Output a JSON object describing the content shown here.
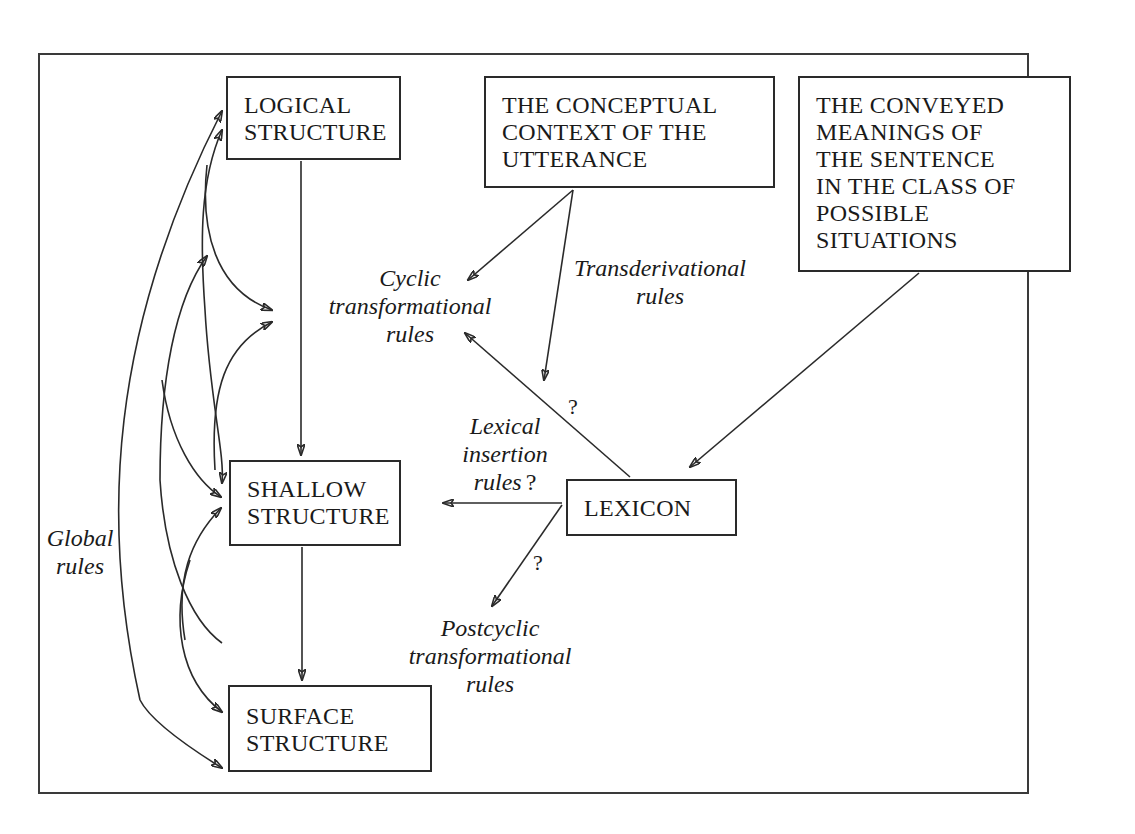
{
  "diagram": {
    "type": "flow-diagram",
    "nodes": {
      "logical_structure": {
        "lines": [
          "LOGICAL",
          "STRUCTURE"
        ]
      },
      "conceptual_context": {
        "lines": [
          "THE CONCEPTUAL",
          "CONTEXT OF THE",
          "UTTERANCE"
        ]
      },
      "conveyed_meanings": {
        "lines": [
          "THE CONVEYED",
          "MEANINGS OF",
          "THE SENTENCE",
          "IN THE CLASS OF",
          "POSSIBLE",
          "SITUATIONS"
        ]
      },
      "shallow_structure": {
        "lines": [
          "SHALLOW",
          "STRUCTURE"
        ]
      },
      "lexicon": {
        "lines": [
          "LEXICON"
        ]
      },
      "surface_structure": {
        "lines": [
          "SURFACE",
          "STRUCTURE"
        ]
      }
    },
    "labels": {
      "cyclic_rules": {
        "lines": [
          "Cyclic",
          "transformational",
          "rules"
        ]
      },
      "transderivational_rules": {
        "lines": [
          "Transderivational",
          "rules"
        ]
      },
      "lexical_insertion_rules": {
        "lines": [
          "Lexical",
          "insertion",
          "rules"
        ],
        "suffix": "?"
      },
      "postcyclic_rules": {
        "lines": [
          "Postcyclic",
          "transformational",
          "rules"
        ]
      },
      "global_rules": {
        "lines": [
          "Global",
          "rules"
        ]
      }
    },
    "question_marks": {
      "lexicon_to_cyclic": "?",
      "lexicon_to_postcyclic": "?"
    },
    "edges": [
      {
        "from": "logical_structure",
        "to": "shallow_structure",
        "label": ""
      },
      {
        "from": "shallow_structure",
        "to": "surface_structure",
        "label": ""
      },
      {
        "from": "conceptual_context",
        "to": "cyclic_rules",
        "label": ""
      },
      {
        "from": "conceptual_context",
        "to": "lexicon_region",
        "label": "Transderivational rules"
      },
      {
        "from": "conveyed_meanings",
        "to": "lexicon",
        "label": ""
      },
      {
        "from": "lexicon",
        "to": "cyclic_rules",
        "label": "?"
      },
      {
        "from": "lexicon",
        "to": "shallow_structure",
        "label": "Lexical insertion rules ?"
      },
      {
        "from": "lexicon",
        "to": "postcyclic_rules",
        "label": "?"
      },
      {
        "from": "global_rules",
        "to": "logical_structure",
        "label": "Global rules",
        "bidirectional": true
      },
      {
        "from": "global_rules",
        "to": "shallow_structure",
        "label": "Global rules",
        "bidirectional": true
      },
      {
        "from": "global_rules",
        "to": "surface_structure",
        "label": "Global rules",
        "bidirectional": true
      }
    ]
  }
}
